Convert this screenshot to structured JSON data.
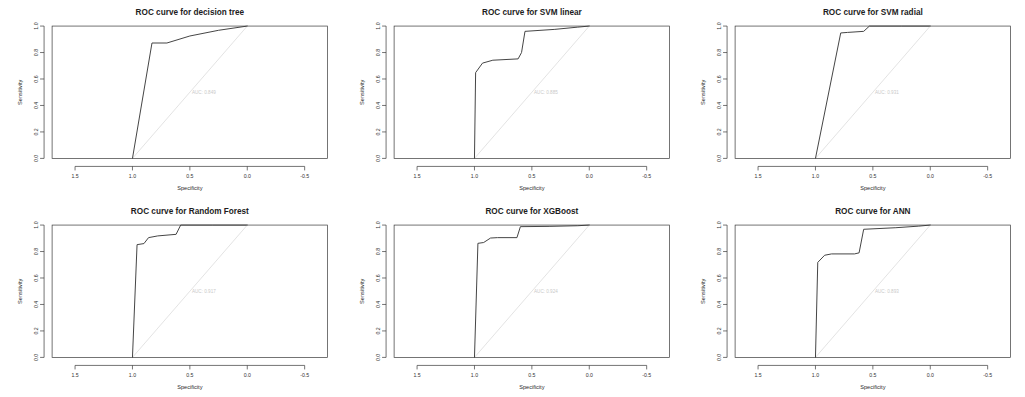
{
  "figure": {
    "layout": "2 rows x 3 columns",
    "axis_x_label": "Specificity",
    "axis_y_label": "Sensitivity",
    "x_ticks": [
      "1.5",
      "1.0",
      "0.5",
      "0.0",
      "-0.5"
    ],
    "y_ticks": [
      "0.0",
      "0.2",
      "0.4",
      "0.6",
      "0.8",
      "1.0"
    ],
    "curve_color": "#3b3b3b",
    "diagonal_color": "#dcdcdc",
    "auc_text_color": "#c9c9c9",
    "background": "#ffffff"
  },
  "chart_data": [
    {
      "type": "line",
      "title": "ROC curve for decision tree",
      "xlabel": "Specificity",
      "ylabel": "Sensitivity",
      "xlim": [
        1.7,
        -0.7
      ],
      "ylim": [
        0.0,
        1.0
      ],
      "x_ticks": [
        1.5,
        1.0,
        0.5,
        0.0,
        -0.5
      ],
      "y_ticks": [
        0.0,
        0.2,
        0.4,
        0.6,
        0.8,
        1.0
      ],
      "grid": false,
      "legend": "none",
      "annotation": "AUC: 0.849",
      "annotation_xy": [
        0.5,
        0.5
      ],
      "series": [
        {
          "name": "ROC",
          "specificity": [
            1.0,
            0.83,
            0.7,
            0.5,
            0.25,
            0.0
          ],
          "sensitivity": [
            0.0,
            0.872,
            0.872,
            0.925,
            0.968,
            1.0
          ]
        },
        {
          "name": "chance diagonal",
          "specificity": [
            1.0,
            0.0
          ],
          "sensitivity": [
            0.0,
            1.0
          ]
        }
      ]
    },
    {
      "type": "line",
      "title": "ROC curve for SVM linear",
      "xlabel": "Specificity",
      "ylabel": "Sensitivity",
      "xlim": [
        1.7,
        -0.7
      ],
      "ylim": [
        0.0,
        1.0
      ],
      "x_ticks": [
        1.5,
        1.0,
        0.5,
        0.0,
        -0.5
      ],
      "y_ticks": [
        0.0,
        0.2,
        0.4,
        0.6,
        0.8,
        1.0
      ],
      "grid": false,
      "legend": "none",
      "annotation": "AUC: 0.885",
      "annotation_xy": [
        0.5,
        0.5
      ],
      "series": [
        {
          "name": "ROC",
          "specificity": [
            1.0,
            0.99,
            0.93,
            0.84,
            0.62,
            0.59,
            0.56,
            0.3,
            0.1,
            0.0
          ],
          "sensitivity": [
            0.0,
            0.648,
            0.72,
            0.742,
            0.752,
            0.8,
            0.96,
            0.975,
            0.992,
            1.0
          ]
        },
        {
          "name": "chance diagonal",
          "specificity": [
            1.0,
            0.0
          ],
          "sensitivity": [
            0.0,
            1.0
          ]
        }
      ]
    },
    {
      "type": "line",
      "title": "ROC curve for SVM radial",
      "xlabel": "Specificity",
      "ylabel": "Sensitivity",
      "xlim": [
        1.7,
        -0.7
      ],
      "ylim": [
        0.0,
        1.0
      ],
      "x_ticks": [
        1.5,
        1.0,
        0.5,
        0.0,
        -0.5
      ],
      "y_ticks": [
        0.0,
        0.2,
        0.4,
        0.6,
        0.8,
        1.0
      ],
      "grid": false,
      "legend": "none",
      "annotation": "AUC: 0.931",
      "annotation_xy": [
        0.5,
        0.5
      ],
      "series": [
        {
          "name": "ROC",
          "specificity": [
            1.0,
            0.78,
            0.72,
            0.58,
            0.53,
            0.25,
            0.0
          ],
          "sensitivity": [
            0.0,
            0.948,
            0.952,
            0.96,
            1.0,
            1.0,
            1.0
          ]
        },
        {
          "name": "chance diagonal",
          "specificity": [
            1.0,
            0.0
          ],
          "sensitivity": [
            0.0,
            1.0
          ]
        }
      ]
    },
    {
      "type": "line",
      "title": "ROC curve for Random Forest",
      "xlabel": "Specificity",
      "ylabel": "Sensitivity",
      "xlim": [
        1.7,
        -0.7
      ],
      "ylim": [
        0.0,
        1.0
      ],
      "x_ticks": [
        1.5,
        1.0,
        0.5,
        0.0,
        -0.5
      ],
      "y_ticks": [
        0.0,
        0.2,
        0.4,
        0.6,
        0.8,
        1.0
      ],
      "grid": false,
      "legend": "none",
      "annotation": "AUC: 0.917",
      "annotation_xy": [
        0.5,
        0.5
      ],
      "series": [
        {
          "name": "ROC",
          "specificity": [
            1.0,
            0.96,
            0.9,
            0.86,
            0.78,
            0.62,
            0.58,
            0.3,
            0.0
          ],
          "sensitivity": [
            0.0,
            0.852,
            0.86,
            0.905,
            0.918,
            0.93,
            1.0,
            1.0,
            1.0
          ]
        },
        {
          "name": "chance diagonal",
          "specificity": [
            1.0,
            0.0
          ],
          "sensitivity": [
            0.0,
            1.0
          ]
        }
      ]
    },
    {
      "type": "line",
      "title": "ROC curve for XGBoost",
      "xlabel": "Specificity",
      "ylabel": "Sensitivity",
      "xlim": [
        1.7,
        -0.7
      ],
      "ylim": [
        0.0,
        1.0
      ],
      "x_ticks": [
        1.5,
        1.0,
        0.5,
        0.0,
        -0.5
      ],
      "y_ticks": [
        0.0,
        0.2,
        0.4,
        0.6,
        0.8,
        1.0
      ],
      "grid": false,
      "legend": "none",
      "annotation": "AUC: 0.924",
      "annotation_xy": [
        0.5,
        0.5
      ],
      "series": [
        {
          "name": "ROC",
          "specificity": [
            1.0,
            0.97,
            0.92,
            0.86,
            0.8,
            0.63,
            0.6,
            0.35,
            0.1,
            0.0
          ],
          "sensitivity": [
            0.0,
            0.862,
            0.868,
            0.902,
            0.905,
            0.905,
            0.988,
            0.99,
            0.995,
            1.0
          ]
        },
        {
          "name": "chance diagonal",
          "specificity": [
            1.0,
            0.0
          ],
          "sensitivity": [
            0.0,
            1.0
          ]
        }
      ]
    },
    {
      "type": "line",
      "title": "ROC curve for ANN",
      "xlabel": "Specificity",
      "ylabel": "Sensitivity",
      "xlim": [
        1.7,
        -0.7
      ],
      "ylim": [
        0.0,
        1.0
      ],
      "x_ticks": [
        1.5,
        1.0,
        0.5,
        0.0,
        -0.5
      ],
      "y_ticks": [
        0.0,
        0.2,
        0.4,
        0.6,
        0.8,
        1.0
      ],
      "grid": false,
      "legend": "none",
      "annotation": "AUC: 0.893",
      "annotation_xy": [
        0.5,
        0.5
      ],
      "series": [
        {
          "name": "ROC",
          "specificity": [
            1.0,
            0.98,
            0.92,
            0.86,
            0.66,
            0.62,
            0.58,
            0.3,
            0.1,
            0.0
          ],
          "sensitivity": [
            0.0,
            0.718,
            0.772,
            0.782,
            0.782,
            0.79,
            0.968,
            0.98,
            0.992,
            1.0
          ]
        },
        {
          "name": "chance diagonal",
          "specificity": [
            1.0,
            0.0
          ],
          "sensitivity": [
            0.0,
            1.0
          ]
        }
      ]
    }
  ]
}
